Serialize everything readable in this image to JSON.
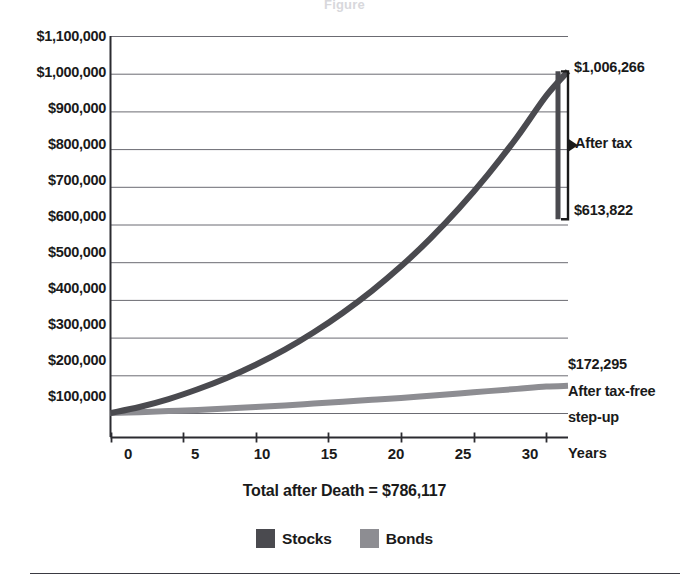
{
  "figure": {
    "ghost_title": "Figure",
    "total_label": "Total after Death = $786,117",
    "x_axis_name": "Years",
    "colors": {
      "stocks": "#4a4a4f",
      "bonds": "#8d8d92",
      "axis": "#2b2b30",
      "grid": "#6b6b72",
      "text": "#1a1a1a"
    }
  },
  "annotations": {
    "peak_value": "$1,006,266",
    "after_tax_value": "$613,822",
    "after_tax_label": "After tax",
    "bonds_value": "$172,295",
    "bonds_label_line1": "After tax-free",
    "bonds_label_line2": "step-up"
  },
  "legend": {
    "items": [
      {
        "label": "Stocks",
        "color": "#4a4a4f"
      },
      {
        "label": "Bonds",
        "color": "#8d8d92"
      }
    ]
  },
  "chart_data": {
    "type": "line",
    "title": "",
    "subtitle": "Total after Death = $786,117",
    "xlabel": "Years",
    "ylabel": "",
    "xlim": [
      0,
      31.5
    ],
    "ylim": [
      0,
      1100000
    ],
    "grid": true,
    "legend_position": "bottom",
    "x_ticks": [
      0,
      5,
      10,
      15,
      20,
      25,
      30
    ],
    "y_ticks": [
      100000,
      200000,
      300000,
      400000,
      500000,
      600000,
      700000,
      800000,
      900000,
      1000000,
      1100000
    ],
    "y_tick_labels": [
      "$100,000",
      "$200,000",
      "$300,000",
      "$400,000",
      "$500,000",
      "$600,000",
      "$700,000",
      "$800,000",
      "$900,000",
      "$1,000,000",
      "$1,100,000"
    ],
    "x": [
      0,
      2,
      4,
      6,
      8,
      10,
      12,
      14,
      16,
      18,
      20,
      22,
      24,
      26,
      28,
      30,
      31.5
    ],
    "series": [
      {
        "name": "Stocks",
        "color": "#4a4a4f",
        "values": [
          100000,
          116000,
          137000,
          163000,
          193000,
          228000,
          268000,
          314000,
          366000,
          424000,
          489000,
          562000,
          643000,
          733000,
          832000,
          941000,
          1006266
        ]
      },
      {
        "name": "Bonds",
        "color": "#8d8d92",
        "values": [
          100000,
          102000,
          105000,
          108000,
          112000,
          116000,
          120000,
          125000,
          130000,
          135000,
          140000,
          146000,
          152000,
          158000,
          164000,
          170000,
          172295
        ]
      }
    ],
    "markers": [
      {
        "name": "stocks-end-peak",
        "x": 31.5,
        "y": 1006266,
        "label": "$1,006,266"
      },
      {
        "name": "stocks-after-tax",
        "x": 31.5,
        "y": 613822,
        "label": "$613,822"
      },
      {
        "name": "bonds-end",
        "x": 31.5,
        "y": 172295,
        "label": "$172,295"
      }
    ],
    "brackets": [
      {
        "name": "after-tax-bracket",
        "from": 613822,
        "to": 1006266,
        "label": "After tax"
      }
    ]
  }
}
